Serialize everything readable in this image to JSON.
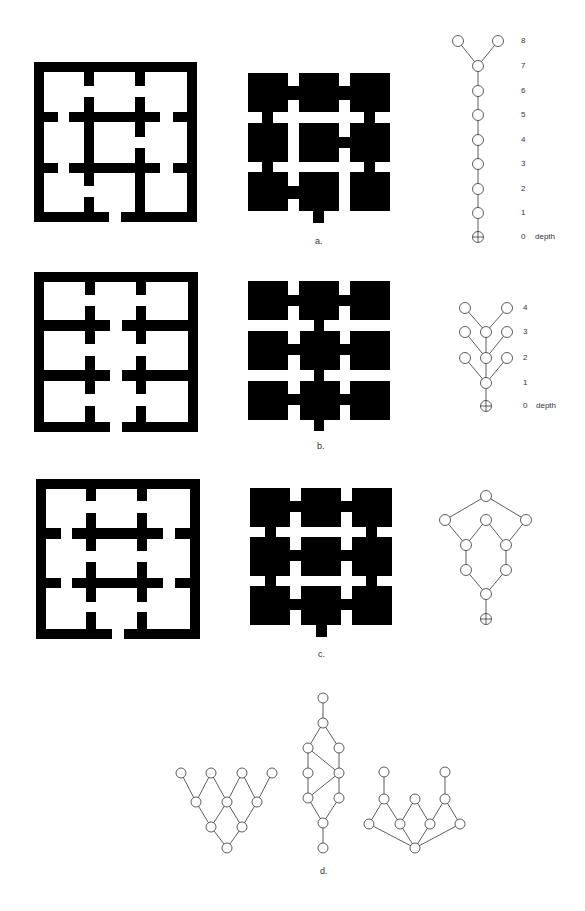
{
  "figure": {
    "panels": [
      {
        "id": "a",
        "caption": "a.",
        "plan_description": "3x3 grid floor plan with walls; entrance at bottom between center columns",
        "dual_description": "rooms as black squares connected by openings",
        "tree_depth_labels": [
          "8",
          "7",
          "6",
          "5",
          "4",
          "3",
          "2",
          "1",
          "0"
        ],
        "depth_word": "depth",
        "tree": {
          "type": "justified-access-graph",
          "root": "carrier (exterior)",
          "max_depth": 8,
          "shape": "linear chain branching into two leaves at depth 8"
        }
      },
      {
        "id": "b",
        "caption": "b.",
        "tree_depth_labels": [
          "4",
          "3",
          "2",
          "1",
          "0"
        ],
        "depth_word": "depth",
        "tree": {
          "type": "justified-access-graph",
          "root": "carrier (exterior)",
          "max_depth": 4,
          "shape": "central spine with side branches at depths 2, 3, 4"
        }
      },
      {
        "id": "c",
        "caption": "c.",
        "tree": {
          "type": "justified-access-graph",
          "root": "carrier (exterior)",
          "shape": "ring (cyclic) graph"
        }
      },
      {
        "id": "d",
        "caption": "d.",
        "graphs": [
          {
            "shape": "inverted lattice, 4 top nodes"
          },
          {
            "shape": "vertical ring lattice with cross-links"
          },
          {
            "shape": "fan with two pendant nodes"
          }
        ]
      }
    ],
    "colors": {
      "ink": "#000000",
      "line": "#333333",
      "background": "#ffffff"
    }
  }
}
